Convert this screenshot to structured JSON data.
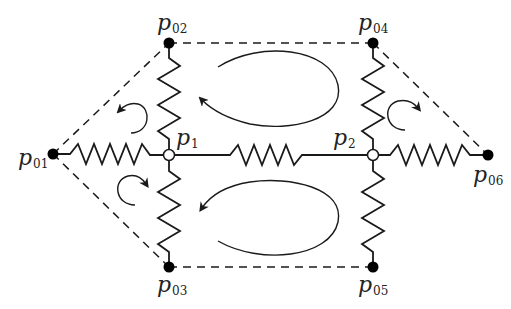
{
  "diagram": {
    "type": "spring-network",
    "colors": {
      "stroke": "#1a1a1a",
      "fixed_node_fill": "#000000",
      "free_node_fill": "#ffffff",
      "background": "#ffffff"
    },
    "nodes": [
      {
        "id": "p01",
        "base": "p",
        "sub": "01",
        "kind": "fixed",
        "x": 53,
        "y": 154
      },
      {
        "id": "p02",
        "base": "p",
        "sub": "02",
        "kind": "fixed",
        "x": 169,
        "y": 43
      },
      {
        "id": "p03",
        "base": "p",
        "sub": "03",
        "kind": "fixed",
        "x": 169,
        "y": 267
      },
      {
        "id": "p04",
        "base": "p",
        "sub": "04",
        "kind": "fixed",
        "x": 373,
        "y": 43
      },
      {
        "id": "p05",
        "base": "p",
        "sub": "05",
        "kind": "fixed",
        "x": 373,
        "y": 267
      },
      {
        "id": "p06",
        "base": "p",
        "sub": "06",
        "kind": "fixed",
        "x": 488,
        "y": 155
      },
      {
        "id": "p1",
        "base": "p",
        "sub": "1",
        "kind": "free",
        "x": 169,
        "y": 155
      },
      {
        "id": "p2",
        "base": "p",
        "sub": "2",
        "kind": "free",
        "x": 373,
        "y": 155
      }
    ],
    "springs": [
      {
        "from": "p01",
        "to": "p1"
      },
      {
        "from": "p1",
        "to": "p2"
      },
      {
        "from": "p2",
        "to": "p06"
      },
      {
        "from": "p02",
        "to": "p1"
      },
      {
        "from": "p1",
        "to": "p03"
      },
      {
        "from": "p04",
        "to": "p2"
      },
      {
        "from": "p2",
        "to": "p05"
      }
    ],
    "dashed_edges": [
      {
        "from": "p01",
        "to": "p02"
      },
      {
        "from": "p01",
        "to": "p03"
      },
      {
        "from": "p02",
        "to": "p04"
      },
      {
        "from": "p03",
        "to": "p05"
      },
      {
        "from": "p04",
        "to": "p06"
      },
      {
        "from": "p05",
        "to": "p06"
      }
    ],
    "loops": [
      {
        "name": "upper-large-loop",
        "direction": "counterclockwise"
      },
      {
        "name": "lower-large-loop",
        "direction": "counterclockwise"
      },
      {
        "name": "upper-left-small-loop",
        "direction": "counterclockwise"
      },
      {
        "name": "lower-left-small-loop",
        "direction": "clockwise"
      },
      {
        "name": "right-small-loop",
        "direction": "clockwise"
      }
    ]
  },
  "labels": {
    "p01": {
      "base": "p",
      "sub": "01"
    },
    "p02": {
      "base": "p",
      "sub": "02"
    },
    "p03": {
      "base": "p",
      "sub": "03"
    },
    "p04": {
      "base": "p",
      "sub": "04"
    },
    "p05": {
      "base": "p",
      "sub": "05"
    },
    "p06": {
      "base": "p",
      "sub": "06"
    },
    "p1": {
      "base": "p",
      "sub": "1"
    },
    "p2": {
      "base": "p",
      "sub": "2"
    }
  }
}
